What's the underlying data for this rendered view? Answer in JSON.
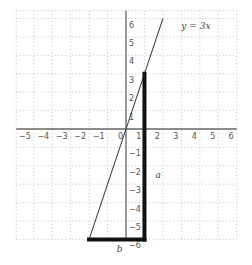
{
  "chart_data": {
    "type": "line",
    "title": "",
    "xlabel": "",
    "ylabel": "",
    "xlim": [
      -6,
      6
    ],
    "ylim": [
      -6,
      6
    ],
    "grid": true,
    "grid_style": "dotted",
    "x_ticks": [
      -5,
      -4,
      -3,
      -2,
      -1,
      0,
      1,
      2,
      3,
      4,
      5,
      6
    ],
    "y_ticks": [
      -6,
      -5,
      -4,
      -3,
      -2,
      -1,
      1,
      2,
      3,
      4,
      5,
      6
    ],
    "series": [
      {
        "name": "y = 3x",
        "equation": "y = 3x",
        "x": [
          -2,
          2
        ],
        "y": [
          -6,
          6
        ],
        "color": "#444444"
      }
    ],
    "annotations": [
      {
        "type": "segment",
        "name": "a",
        "from": [
          1,
          -6
        ],
        "to": [
          1,
          3
        ],
        "style": "thick",
        "color": "#111111"
      },
      {
        "type": "segment",
        "name": "b",
        "from": [
          -2,
          -6
        ],
        "to": [
          1,
          -6
        ],
        "style": "thick",
        "color": "#111111"
      },
      {
        "type": "text",
        "text": "a",
        "at": [
          1.6,
          -2.5
        ]
      },
      {
        "type": "text",
        "text": "b",
        "at": [
          -0.5,
          -6.5
        ]
      },
      {
        "type": "text",
        "text": "y = 3x",
        "at": [
          3.0,
          5.6
        ]
      }
    ],
    "legend": "none"
  },
  "labels": {
    "line_label": "y = 3x",
    "segment_a": "a",
    "segment_b": "b"
  },
  "colors": {
    "grid": "#b5b5b5",
    "axis": "#666666",
    "line": "#444444",
    "segments": "#111111"
  }
}
